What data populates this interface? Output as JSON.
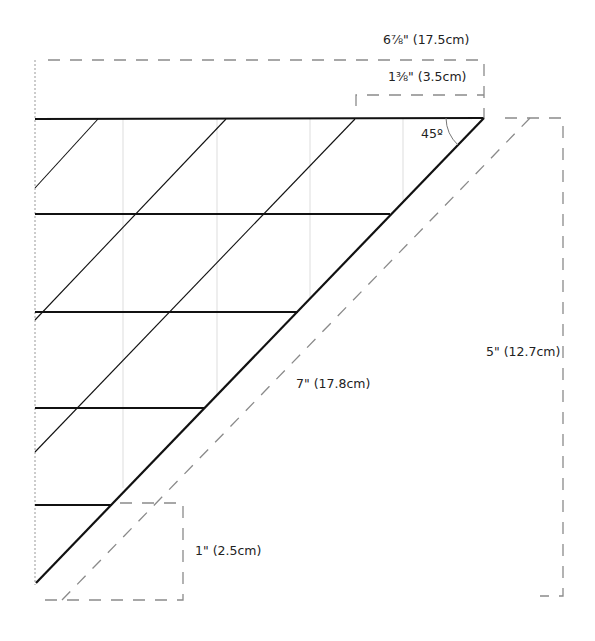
{
  "diagram": {
    "type": "quilt-template-triangle",
    "angle_label": "45º",
    "dimensions": {
      "total_width": "6⅞\" (17.5cm)",
      "tip_offset": "1⅜\" (3.5cm)",
      "hypotenuse": "7\" (17.8cm)",
      "height": "5\" (12.7cm)",
      "seam_allowance": "1\" (2.5cm)"
    },
    "colors": {
      "solid_line": "#111111",
      "dashed_line": "#8a8a8a",
      "grid_line": "#dddddd",
      "text": "#222222"
    }
  }
}
